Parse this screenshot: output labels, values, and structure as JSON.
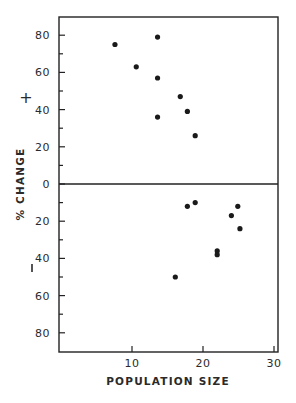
{
  "chart_data": {
    "type": "scatter",
    "title": "",
    "xlabel": "POPULATION SIZE",
    "ylabel": "% CHANGE",
    "xlim": [
      0,
      30
    ],
    "ylim": [
      -90,
      90
    ],
    "x_ticks": [
      10,
      20,
      30
    ],
    "y_tick_labels_upper": [
      "80",
      "60",
      "40",
      "20",
      "0"
    ],
    "y_tick_labels_lower": [
      "20",
      "40",
      "60",
      "80"
    ],
    "y_tick_values_upper": [
      80,
      60,
      40,
      20,
      0
    ],
    "y_tick_values_lower": [
      -20,
      -40,
      -60,
      -80
    ],
    "sign_labels": {
      "positive": "+",
      "negative": "−"
    },
    "zero_line": true,
    "grid": false,
    "legend": null,
    "series": [
      {
        "name": "increase",
        "points": [
          {
            "x": 7.6,
            "y": 75
          },
          {
            "x": 10.6,
            "y": 63
          },
          {
            "x": 13.6,
            "y": 79
          },
          {
            "x": 13.6,
            "y": 57
          },
          {
            "x": 13.6,
            "y": 36
          },
          {
            "x": 16.8,
            "y": 47
          },
          {
            "x": 17.8,
            "y": 39
          },
          {
            "x": 18.9,
            "y": 26
          }
        ]
      },
      {
        "name": "decrease",
        "points": [
          {
            "x": 17.8,
            "y": -12
          },
          {
            "x": 18.9,
            "y": -10
          },
          {
            "x": 24.9,
            "y": -12
          },
          {
            "x": 24.0,
            "y": -17
          },
          {
            "x": 25.2,
            "y": -24
          },
          {
            "x": 22.0,
            "y": -36
          },
          {
            "x": 22.0,
            "y": -38
          },
          {
            "x": 16.1,
            "y": -50
          }
        ]
      }
    ]
  }
}
